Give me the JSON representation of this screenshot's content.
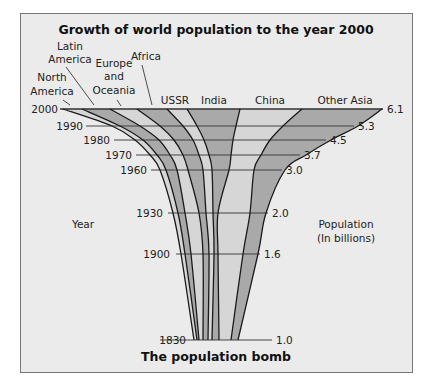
{
  "chart_data": {
    "type": "area",
    "title": "Growth of world population to the year 2000",
    "subtitle": "The population bomb",
    "xlabel": "Population (In billions)",
    "ylabel": "Year",
    "years": [
      1830,
      1900,
      1930,
      1960,
      1970,
      1980,
      1990,
      2000
    ],
    "total_population_billions": [
      1.0,
      1.6,
      2.0,
      3.0,
      3.7,
      4.5,
      5.3,
      6.1
    ],
    "regions": [
      "North America",
      "Latin America",
      "Europe and Oceania",
      "Africa",
      "USSR",
      "India",
      "China",
      "Other Asia"
    ],
    "region_order_left_to_right": [
      "North America",
      "Latin America",
      "Europe and Oceania",
      "Africa",
      "USSR",
      "India",
      "China",
      "Other Asia"
    ],
    "stripe_shading": [
      "light",
      "dark",
      "light",
      "dark",
      "light",
      "dark",
      "light",
      "dark",
      "light"
    ],
    "boundaries_px": {
      "2000": [
        63,
        82,
        110,
        137,
        167,
        187,
        240,
        302,
        382
      ],
      "1990": [
        112,
        120,
        140,
        160,
        183,
        197,
        236,
        283,
        358
      ],
      "1980": [
        135,
        143,
        159,
        174,
        193,
        204,
        233,
        270,
        331
      ],
      "1970": [
        150,
        157,
        170,
        183,
        199,
        209,
        231,
        261,
        306
      ],
      "1960": [
        160,
        166,
        177,
        188,
        203,
        212,
        229,
        254,
        285
      ],
      "1930": [
        173,
        178,
        185,
        199,
        206,
        213,
        218,
        250,
        266
      ],
      "1900": [
        181,
        185,
        191,
        203,
        209,
        214,
        218,
        243,
        258
      ],
      "1830": [
        194,
        197,
        199,
        203,
        208,
        212,
        219,
        231,
        238
      ]
    },
    "year_y_px": {
      "2000": 109,
      "1990": 126,
      "1980": 140,
      "1970": 155,
      "1960": 170,
      "1930": 213,
      "1900": 254,
      "1830": 340
    },
    "grid": false,
    "legend": "inline labels above top edge"
  },
  "labels": {
    "title": "Growth of world population to the year 2000",
    "subtitle": "The population bomb",
    "year_axis": "Year",
    "population_axis_line1": "Population",
    "population_axis_line2": "(In billions)",
    "north_america_1": "North",
    "north_america_2": "America",
    "latin_america_1": "Latin",
    "latin_america_2": "America",
    "europe_1": "Europe",
    "europe_2": "and",
    "europe_3": "Oceania",
    "africa": "Africa",
    "ussr": "USSR",
    "india": "India",
    "china": "China",
    "other_asia": "Other Asia"
  },
  "ticks": {
    "years": [
      "2000",
      "1990",
      "1980",
      "1970",
      "1960",
      "1930",
      "1900",
      "1830"
    ],
    "population": [
      "6.1",
      "5.3",
      "4.5",
      "3.7",
      "3.0",
      "2.0",
      "1.6",
      "1.0"
    ]
  },
  "colors": {
    "background": "#ebebeb",
    "light_stripe": "#d6d6d6",
    "dark_stripe": "#a9a9a9",
    "line": "#1a1a1a"
  }
}
